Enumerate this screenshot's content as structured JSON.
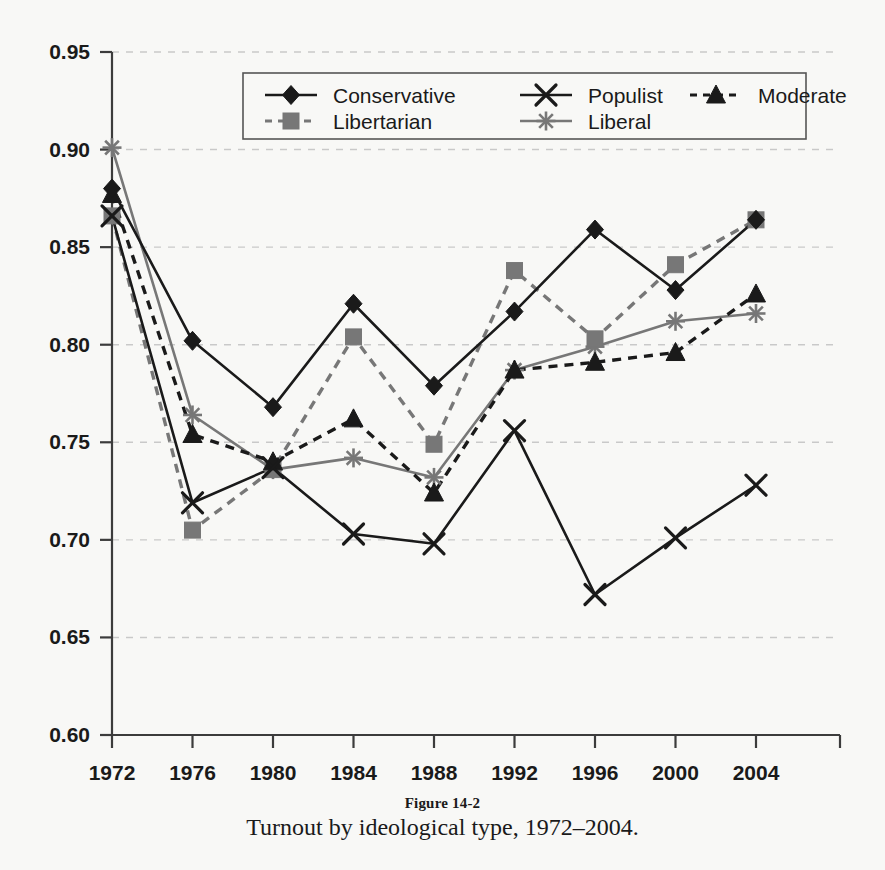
{
  "figure": {
    "number_label": "Figure 14-2",
    "caption": "Turnout by ideological type, 1972–2004."
  },
  "colors": {
    "background": "#f8f8f6",
    "axis": "#3c3c3c",
    "gridline": "#c9c9c9",
    "dark_series": "#1a1a1a",
    "gray_series": "#777777",
    "text": "#1a1a1a"
  },
  "legend": {
    "position": "top-center-inside",
    "bordered": true,
    "entries": [
      {
        "label": "Conservative",
        "marker": "diamond",
        "line": "solid",
        "color": "#1a1a1a"
      },
      {
        "label": "Populist",
        "marker": "x",
        "line": "solid",
        "color": "#1a1a1a"
      },
      {
        "label": "Moderate",
        "marker": "triangle",
        "line": "dashed",
        "color": "#1a1a1a"
      },
      {
        "label": "Libertarian",
        "marker": "square",
        "line": "dashed",
        "color": "#777777"
      },
      {
        "label": "Liberal",
        "marker": "asterisk",
        "line": "solid",
        "color": "#777777"
      }
    ]
  },
  "chart_data": {
    "type": "line",
    "title": "Turnout by ideological type, 1972–2004.",
    "xlabel": "",
    "ylabel": "",
    "x": [
      1972,
      1976,
      1980,
      1984,
      1988,
      1992,
      1996,
      2000,
      2004
    ],
    "xtick_labels": [
      "1972",
      "1976",
      "1980",
      "1984",
      "1988",
      "1992",
      "1996",
      "2000",
      "2004"
    ],
    "ytick_labels": [
      "0.95",
      "0.90",
      "0.85",
      "0.80",
      "0.75",
      "0.70",
      "0.65",
      "0.60"
    ],
    "yticks": [
      0.95,
      0.9,
      0.85,
      0.8,
      0.75,
      0.7,
      0.65,
      0.6
    ],
    "ylim": [
      0.6,
      0.95
    ],
    "grid": "horizontal-dashed",
    "legend_position": "top-center",
    "series": [
      {
        "name": "Conservative",
        "marker": "diamond",
        "line": "solid",
        "color": "#1a1a1a",
        "values": [
          0.88,
          0.802,
          0.768,
          0.821,
          0.779,
          0.817,
          0.859,
          0.828,
          0.864
        ]
      },
      {
        "name": "Populist",
        "marker": "x",
        "line": "solid",
        "color": "#1a1a1a",
        "values": [
          0.866,
          0.719,
          0.737,
          0.703,
          0.698,
          0.756,
          0.672,
          0.701,
          0.728
        ]
      },
      {
        "name": "Moderate",
        "marker": "triangle",
        "line": "dashed",
        "color": "#1a1a1a",
        "values": [
          0.877,
          0.754,
          0.74,
          0.762,
          0.724,
          0.787,
          0.791,
          0.796,
          0.826
        ]
      },
      {
        "name": "Libertarian",
        "marker": "square",
        "line": "dashed",
        "color": "#777777",
        "values": [
          0.866,
          0.705,
          0.736,
          0.804,
          0.749,
          0.838,
          0.803,
          0.841,
          0.864
        ]
      },
      {
        "name": "Liberal",
        "marker": "asterisk",
        "line": "solid",
        "color": "#777777",
        "values": [
          0.901,
          0.764,
          0.736,
          0.742,
          0.732,
          0.787,
          0.799,
          0.812,
          0.816
        ]
      }
    ]
  }
}
